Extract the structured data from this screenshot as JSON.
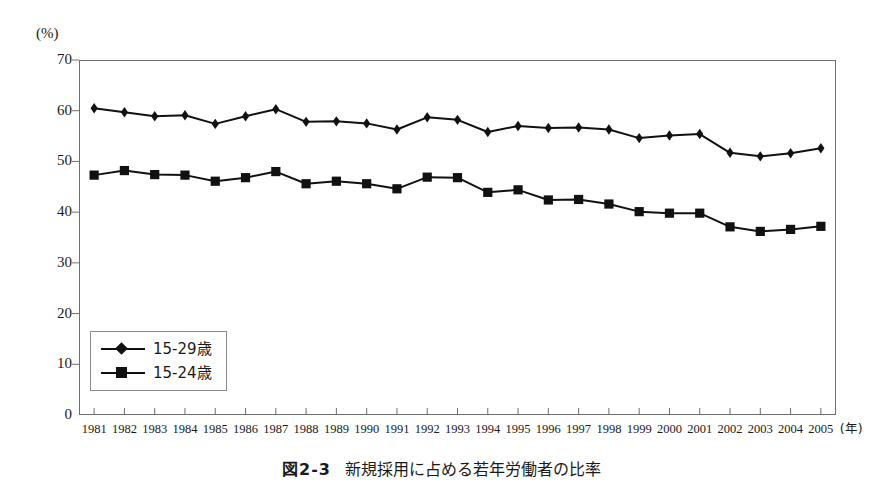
{
  "figure": {
    "unit_label": "(%)",
    "caption_number": "図2-3",
    "caption_title": "新規採用に占める若年労働者の比率"
  },
  "axes": {
    "y_ticks": [
      "70",
      "60",
      "50",
      "40",
      "30",
      "20",
      "10",
      "0"
    ],
    "x_unit": "(年)"
  },
  "legend": {
    "items": [
      {
        "label": "15-29歳",
        "marker": "diamond"
      },
      {
        "label": "15-24歳",
        "marker": "square"
      }
    ]
  },
  "chart_data": {
    "type": "line",
    "xlabel": "(年)",
    "ylabel": "(%)",
    "ylim": [
      0,
      70
    ],
    "ytick_step": 10,
    "grid": false,
    "legend_position": "lower-left-inside",
    "categories": [
      "1981",
      "1982",
      "1983",
      "1984",
      "1985",
      "1986",
      "1987",
      "1988",
      "1989",
      "1990",
      "1991",
      "1992",
      "1993",
      "1994",
      "1995",
      "1996",
      "1997",
      "1998",
      "1999",
      "2000",
      "2001",
      "2002",
      "2003",
      "2004",
      "2005"
    ],
    "series": [
      {
        "name": "15-29歳",
        "marker": "diamond",
        "color": "#111111",
        "values": [
          60.5,
          59.7,
          58.9,
          59.1,
          57.4,
          58.9,
          60.3,
          57.8,
          57.9,
          57.5,
          56.3,
          58.7,
          58.2,
          55.8,
          57.0,
          56.6,
          56.7,
          56.3,
          54.6,
          55.1,
          55.4,
          51.7,
          51.0,
          51.6,
          52.6
        ]
      },
      {
        "name": "15-24歳",
        "marker": "square",
        "color": "#111111",
        "values": [
          47.3,
          48.2,
          47.4,
          47.3,
          46.1,
          46.8,
          48.0,
          45.6,
          46.1,
          45.6,
          44.6,
          46.9,
          46.8,
          43.9,
          44.4,
          42.4,
          42.5,
          41.6,
          40.1,
          39.8,
          39.8,
          37.1,
          36.2,
          36.6,
          37.2
        ]
      }
    ]
  }
}
